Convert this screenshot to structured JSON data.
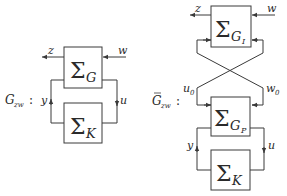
{
  "left_diagram": {
    "system_label": "G",
    "system_prefix": "G",
    "system_sub": "zw",
    "colon": ":",
    "plant": {
      "symbol": "Σ",
      "sub": "G"
    },
    "controller": {
      "symbol": "Σ",
      "sub": "K"
    },
    "signals": {
      "z": "z",
      "w": "w",
      "y": "y",
      "u": "u"
    }
  },
  "right_diagram": {
    "system_prefix": "G",
    "system_bar": "¯",
    "system_sub": "zw",
    "colon": ":",
    "upper_block": {
      "symbol": "Σ",
      "sub": "G",
      "subsub": "I"
    },
    "lower_block": {
      "symbol": "Σ",
      "sub": "G",
      "subsub": "P"
    },
    "controller": {
      "symbol": "Σ",
      "sub": "K"
    },
    "signals": {
      "z": "z",
      "w": "w",
      "u0": "u",
      "u0_sub": "0",
      "w0": "w",
      "w0_sub": "0",
      "y": "y",
      "u": "u"
    }
  },
  "colors": {
    "line": "#3a3a3a",
    "box_fill": "#ffffff",
    "text": "#2a2a2a"
  }
}
